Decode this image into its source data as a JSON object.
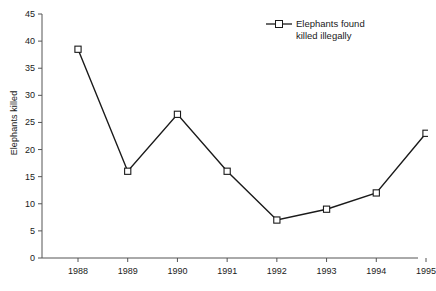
{
  "chart_data": {
    "type": "line",
    "title": "",
    "xlabel": "",
    "ylabel": "Elephants killed",
    "categories": [
      "1988",
      "1989",
      "1990",
      "1991",
      "1992",
      "1993",
      "1994",
      "1995"
    ],
    "x": [
      1988,
      1989,
      1990,
      1991,
      1992,
      1993,
      1994,
      1995
    ],
    "series": [
      {
        "name": "Elephants found killed illegally",
        "values": [
          38.5,
          16,
          26.5,
          16,
          7,
          9,
          12,
          23
        ]
      }
    ],
    "ylim": [
      0,
      45
    ],
    "yticks": [
      0,
      5,
      10,
      15,
      20,
      25,
      30,
      35,
      40,
      45
    ],
    "ytick_labels": [
      "0",
      "5",
      "10",
      "15",
      "20",
      "25",
      "30",
      "35",
      "40",
      "45"
    ],
    "xtick_labels": [
      "1988",
      "1989",
      "1990",
      "1991",
      "1992",
      "1993",
      "1994",
      "1995"
    ],
    "grid": false,
    "legend_position": "top-right",
    "marker": "open-square",
    "line_color": "#1a1a1a",
    "marker_fill": "#ffffff",
    "marker_stroke": "#1a1a1a",
    "background": "#ffffff"
  },
  "legend": {
    "entries": [
      {
        "line1": "Elephants found",
        "line2": "killed illegally"
      }
    ]
  },
  "axes": {
    "y_title": "Elephants killed"
  }
}
